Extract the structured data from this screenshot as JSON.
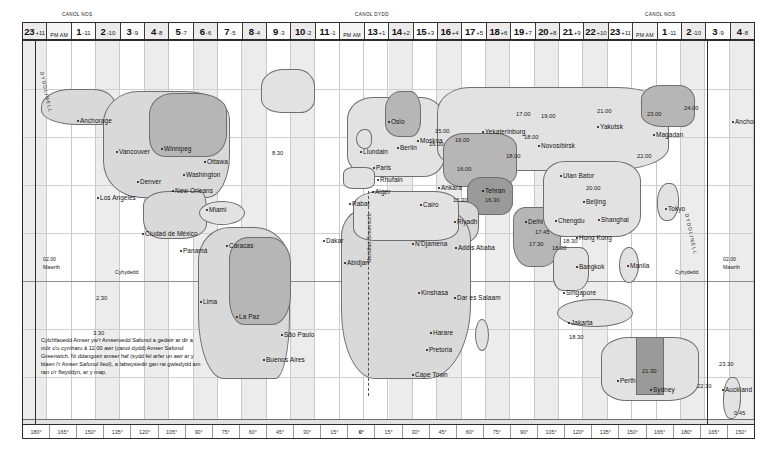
{
  "header": {
    "midnight_left_label": "CANOL NOS",
    "midday_label": "CANOL DYDD",
    "midnight_right_label": "CANOL NOS",
    "ampm_label": "PM AM",
    "zones": [
      {
        "hour": "23",
        "offset": "+11",
        "shaded": true
      },
      {
        "hour": "",
        "offset": "",
        "ampm": true
      },
      {
        "hour": "1",
        "offset": "-11",
        "shaded": false
      },
      {
        "hour": "2",
        "offset": "-10",
        "shaded": true
      },
      {
        "hour": "3",
        "offset": "-9",
        "shaded": false
      },
      {
        "hour": "4",
        "offset": "-8",
        "shaded": true
      },
      {
        "hour": "5",
        "offset": "-7",
        "shaded": false
      },
      {
        "hour": "6",
        "offset": "-6",
        "shaded": true
      },
      {
        "hour": "7",
        "offset": "-5",
        "shaded": false
      },
      {
        "hour": "8",
        "offset": "-4",
        "shaded": true
      },
      {
        "hour": "9",
        "offset": "-3",
        "shaded": false
      },
      {
        "hour": "10",
        "offset": "-2",
        "shaded": true
      },
      {
        "hour": "11",
        "offset": "-1",
        "shaded": false
      },
      {
        "hour": "",
        "offset": "",
        "ampm": true
      },
      {
        "hour": "13",
        "offset": "+1",
        "shaded": false
      },
      {
        "hour": "14",
        "offset": "+2",
        "shaded": true
      },
      {
        "hour": "15",
        "offset": "+3",
        "shaded": false
      },
      {
        "hour": "16",
        "offset": "+4",
        "shaded": true
      },
      {
        "hour": "17",
        "offset": "+5",
        "shaded": false
      },
      {
        "hour": "18",
        "offset": "+6",
        "shaded": true
      },
      {
        "hour": "19",
        "offset": "+7",
        "shaded": false
      },
      {
        "hour": "20",
        "offset": "+8",
        "shaded": true
      },
      {
        "hour": "21",
        "offset": "+9",
        "shaded": false
      },
      {
        "hour": "22",
        "offset": "+10",
        "shaded": true
      },
      {
        "hour": "23",
        "offset": "+11",
        "shaded": false
      },
      {
        "hour": "",
        "offset": "",
        "ampm": true
      },
      {
        "hour": "1",
        "offset": "-11",
        "shaded": false
      },
      {
        "hour": "2",
        "offset": "-10",
        "shaded": true
      },
      {
        "hour": "3",
        "offset": "-9",
        "shaded": false
      },
      {
        "hour": "4",
        "offset": "-8",
        "shaded": true
      }
    ]
  },
  "axis": {
    "ticks": [
      "180°",
      "165°",
      "150°",
      "135°",
      "120°",
      "105°",
      "90°",
      "75°",
      "60°",
      "45°",
      "30°",
      "15°",
      "0°",
      "15°",
      "30°",
      "45°",
      "60°",
      "75°",
      "90°",
      "105°",
      "120°",
      "135°",
      "150°",
      "165°",
      "180°",
      "165°",
      "150°"
    ]
  },
  "labels": {
    "dateline_left": "DYDDLINELL",
    "dateline_right": "DYDDLINELL",
    "meridian": "Meridian Greenwich",
    "equator_left": "Cyhydedd",
    "equator_right": "Cyhydedd",
    "day_left_time": "02.00",
    "day_left_name": "Mawrth",
    "day_right_time": "02.00",
    "day_right_name": "Mawrth"
  },
  "legend": {
    "text": "Cylchfaoedd Amser yw'r Amseroedd Safonol a gedwir ar dir a môr o'u cymharu â 12.00 awr (canol dydd) Amser Safonol Greenwich. Ni ddangosir amser haf (sydd fel arfer un awr ar y blaen i'r Amser Safonol lleol), a labwysiedir gan rai gwledydd am ran o'r flwyddyn, ar y map."
  },
  "cities": [
    {
      "name": "Anchorage",
      "x": 57,
      "y": 76
    },
    {
      "name": "Vancouver",
      "x": 96,
      "y": 107
    },
    {
      "name": "Winnipeg",
      "x": 141,
      "y": 104
    },
    {
      "name": "Ottawa",
      "x": 184,
      "y": 117
    },
    {
      "name": "Denver",
      "x": 117,
      "y": 137
    },
    {
      "name": "Washington",
      "x": 163,
      "y": 130
    },
    {
      "name": "New Orleans",
      "x": 152,
      "y": 146
    },
    {
      "name": "Los Angeles",
      "x": 77,
      "y": 153
    },
    {
      "name": "Miami",
      "x": 186,
      "y": 165
    },
    {
      "name": "Ciudad de México",
      "x": 122,
      "y": 189
    },
    {
      "name": "Panamá",
      "x": 160,
      "y": 206
    },
    {
      "name": "Caracas",
      "x": 206,
      "y": 201
    },
    {
      "name": "Lima",
      "x": 180,
      "y": 257
    },
    {
      "name": "La Paz",
      "x": 216,
      "y": 272
    },
    {
      "name": "São Paulo",
      "x": 261,
      "y": 290
    },
    {
      "name": "Buenos Aires",
      "x": 243,
      "y": 315
    },
    {
      "name": "Oslo",
      "x": 368,
      "y": 77
    },
    {
      "name": "Moskva",
      "x": 397,
      "y": 96
    },
    {
      "name": "Llundain",
      "x": 340,
      "y": 107
    },
    {
      "name": "Berlin",
      "x": 377,
      "y": 103
    },
    {
      "name": "Paris",
      "x": 353,
      "y": 123
    },
    {
      "name": "Rhufain",
      "x": 357,
      "y": 135
    },
    {
      "name": "Alger",
      "x": 352,
      "y": 147
    },
    {
      "name": "Rabat",
      "x": 329,
      "y": 159
    },
    {
      "name": "Cairo",
      "x": 400,
      "y": 160
    },
    {
      "name": "Ankara",
      "x": 418,
      "y": 143
    },
    {
      "name": "Tehran",
      "x": 462,
      "y": 146
    },
    {
      "name": "Riyadh",
      "x": 434,
      "y": 177
    },
    {
      "name": "Dakar",
      "x": 303,
      "y": 196
    },
    {
      "name": "N'Djamena",
      "x": 392,
      "y": 199
    },
    {
      "name": "Addis Ababa",
      "x": 435,
      "y": 203
    },
    {
      "name": "Abidjan",
      "x": 324,
      "y": 218
    },
    {
      "name": "Kinshasa",
      "x": 398,
      "y": 248
    },
    {
      "name": "Dar es Salaam",
      "x": 434,
      "y": 253
    },
    {
      "name": "Harare",
      "x": 410,
      "y": 288
    },
    {
      "name": "Pretoria",
      "x": 406,
      "y": 305
    },
    {
      "name": "Cape Town",
      "x": 392,
      "y": 330
    },
    {
      "name": "Yekaterinburg",
      "x": 462,
      "y": 87
    },
    {
      "name": "Novosibirsk",
      "x": 518,
      "y": 101
    },
    {
      "name": "Yakutsk",
      "x": 577,
      "y": 82
    },
    {
      "name": "Magadan",
      "x": 633,
      "y": 90
    },
    {
      "name": "Ulan Bator",
      "x": 540,
      "y": 131
    },
    {
      "name": "Beijing",
      "x": 563,
      "y": 157
    },
    {
      "name": "Shanghai",
      "x": 578,
      "y": 175
    },
    {
      "name": "Chengdu",
      "x": 535,
      "y": 176
    },
    {
      "name": "Delhi",
      "x": 505,
      "y": 177
    },
    {
      "name": "Hong Kong",
      "x": 556,
      "y": 193
    },
    {
      "name": "Tokyo",
      "x": 645,
      "y": 164
    },
    {
      "name": "Bangkok",
      "x": 556,
      "y": 222
    },
    {
      "name": "Manila",
      "x": 607,
      "y": 221
    },
    {
      "name": "Singapore",
      "x": 543,
      "y": 248
    },
    {
      "name": "Jakarta",
      "x": 548,
      "y": 278
    },
    {
      "name": "Perth",
      "x": 597,
      "y": 336
    },
    {
      "name": "Sydney",
      "x": 630,
      "y": 345
    },
    {
      "name": "Auckland",
      "x": 702,
      "y": 345
    },
    {
      "name": "Anchorage",
      "x": 712,
      "y": 77
    }
  ],
  "times": [
    {
      "v": "15.00",
      "x": 412,
      "y": 87
    },
    {
      "v": "16.00",
      "x": 406,
      "y": 100
    },
    {
      "v": "16.00",
      "x": 432,
      "y": 96
    },
    {
      "v": "16.00",
      "x": 434,
      "y": 125
    },
    {
      "v": "17.00",
      "x": 493,
      "y": 70
    },
    {
      "v": "19.00",
      "x": 518,
      "y": 72
    },
    {
      "v": "21.00",
      "x": 574,
      "y": 67
    },
    {
      "v": "23.00",
      "x": 624,
      "y": 70
    },
    {
      "v": "24.00",
      "x": 661,
      "y": 64
    },
    {
      "v": "18.00",
      "x": 483,
      "y": 112
    },
    {
      "v": "18.00",
      "x": 501,
      "y": 93
    },
    {
      "v": "22.00",
      "x": 614,
      "y": 112
    },
    {
      "v": "20.00",
      "x": 563,
      "y": 144
    },
    {
      "v": "15.30",
      "x": 430,
      "y": 156
    },
    {
      "v": "16.30",
      "x": 462,
      "y": 156
    },
    {
      "v": "17.45",
      "x": 512,
      "y": 188
    },
    {
      "v": "17.30",
      "x": 506,
      "y": 200
    },
    {
      "v": "18.00",
      "x": 529,
      "y": 204
    },
    {
      "v": "18.30",
      "x": 540,
      "y": 197
    },
    {
      "v": "18.30",
      "x": 546,
      "y": 293
    },
    {
      "v": "8.30",
      "x": 249,
      "y": 109
    },
    {
      "v": "2.30",
      "x": 73,
      "y": 254
    },
    {
      "v": "3.30",
      "x": 70,
      "y": 289
    },
    {
      "v": "21.30",
      "x": 619,
      "y": 327
    },
    {
      "v": "22.30",
      "x": 674,
      "y": 342
    },
    {
      "v": "23.30",
      "x": 696,
      "y": 320
    },
    {
      "v": "0.45",
      "x": 711,
      "y": 369
    }
  ]
}
